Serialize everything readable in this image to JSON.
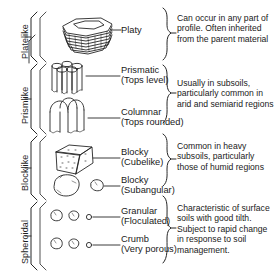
{
  "figure": {
    "ink_color": "#1a1a1a",
    "background": "#ffffff"
  },
  "columns": {
    "category_header": "Type",
    "illustration_header": "Structural unit",
    "comment_header": "Comments"
  },
  "rows": [
    {
      "category": "Platelike",
      "units": [
        {
          "label": "Platy",
          "sublabel": ""
        }
      ],
      "comment": "Can occur in any part of profile. Often inherited from the parent material"
    },
    {
      "category": "Prismlike",
      "units": [
        {
          "label": "Prismatic",
          "sublabel": "(Tops level)"
        },
        {
          "label": "Columnar",
          "sublabel": "(Tops rounded)"
        }
      ],
      "comment": "Usually in subsoils, particularly common in arid and semiarid regions"
    },
    {
      "category": "Blocklike",
      "units": [
        {
          "label": "Blocky",
          "sublabel": "(Cubelike)"
        },
        {
          "label": "Blocky",
          "sublabel": "(Subangular)"
        }
      ],
      "comment": "Common in heavy subsoils, particularly those of humid regions"
    },
    {
      "category": "Spheroidal",
      "units": [
        {
          "label": "Granular",
          "sublabel": "(Floculated)"
        },
        {
          "label": "Crumb",
          "sublabel": "(Very porous)"
        }
      ],
      "comment": "Characteristic of surface soils with good tilth. Subject to rapid change in response to soil management."
    }
  ],
  "icons": {
    "platy": "platy-aggregate-icon",
    "prismatic": "prismatic-aggregate-icon",
    "columnar": "columnar-aggregate-icon",
    "blocky_cube": "blocky-cubelike-aggregate-icon",
    "blocky_sub": "blocky-subangular-aggregate-icon",
    "granular": "granular-aggregate-icon",
    "crumb": "crumb-aggregate-icon",
    "left_bracket": "category-bracket-icon",
    "right_bracket": "comment-brace-icon",
    "leader": "leader-line-icon"
  }
}
